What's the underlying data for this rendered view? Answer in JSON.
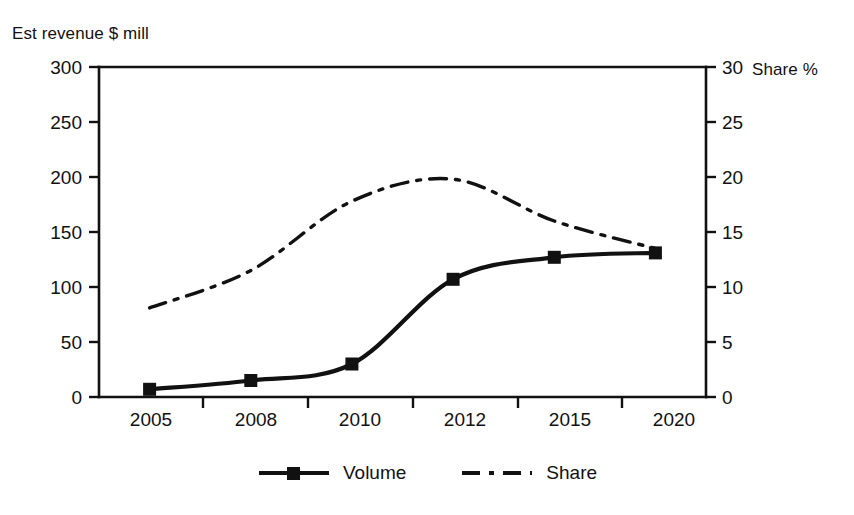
{
  "chart_data": {
    "type": "line",
    "title": "",
    "subtitle": "",
    "categories": [
      "2005",
      "2008",
      "2010",
      "2012",
      "2015",
      "2020"
    ],
    "series": [
      {
        "name": "Volume",
        "axis": "left",
        "style": "solid",
        "marker": "square",
        "values": [
          7,
          15,
          30,
          107,
          127,
          131
        ]
      },
      {
        "name": "Share",
        "axis": "right",
        "style": "dash-dot",
        "marker": "none",
        "values": [
          8.1,
          11.5,
          17.8,
          19.8,
          16.0,
          13.5
        ]
      }
    ],
    "ylabel": "Est revenue $ mill",
    "ylabel_right": "Share %",
    "xlabel": "",
    "ylim": [
      0,
      300
    ],
    "ylim_right": [
      0,
      30
    ],
    "yticks": [
      "0",
      "50",
      "100",
      "150",
      "200",
      "250",
      "300"
    ],
    "yticks_right": [
      "0",
      "5",
      "10",
      "15",
      "20",
      "25",
      "30"
    ],
    "grid": false,
    "legend_position": "bottom"
  },
  "axes": {
    "left_title": "Est revenue $ mill",
    "right_title": "Share %",
    "left_ticks": [
      "300",
      "250",
      "200",
      "150",
      "100",
      "50",
      "0"
    ],
    "right_ticks": [
      "30",
      "25",
      "20",
      "15",
      "10",
      "5",
      "0"
    ],
    "x_categories": [
      "2005",
      "2008",
      "2010",
      "2012",
      "2015",
      "2020"
    ]
  },
  "legend": {
    "items": [
      {
        "label": "Volume",
        "icon": "solid-line-square-marker"
      },
      {
        "label": "Share",
        "icon": "dash-dot-line"
      }
    ]
  },
  "colors": {
    "ink": "#111111",
    "background": "#ffffff"
  }
}
